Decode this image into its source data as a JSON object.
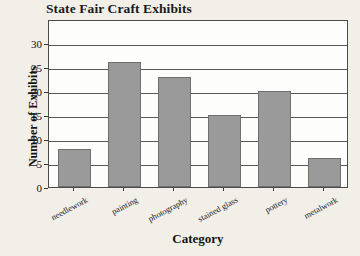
{
  "chart_data": {
    "type": "bar",
    "title": "State Fair Craft Exhibits",
    "xlabel": "Category",
    "ylabel": "Number of Exhibits",
    "categories": [
      "needlework",
      "painting",
      "photography",
      "stained glass",
      "pottery",
      "metalwork"
    ],
    "values": [
      8,
      26,
      23,
      15,
      20,
      6
    ],
    "yticks": [
      0,
      5,
      10,
      15,
      20,
      25,
      30
    ],
    "ylim": [
      0,
      35
    ],
    "grid": true,
    "legend": "none",
    "bar_color": "#9a9a9a",
    "bar_edge_color": "#6f6f6f",
    "plot_background": "#fdfdfb",
    "figure_background": "#f2efe9",
    "axis_color": "#4a4a4a"
  }
}
